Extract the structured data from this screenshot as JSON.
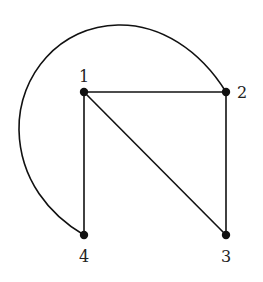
{
  "diagram": {
    "type": "graph",
    "directed": false,
    "nodes": [
      {
        "id": "1",
        "label": "1",
        "x": 84,
        "y": 92,
        "label_x": 84,
        "label_y": 77
      },
      {
        "id": "2",
        "label": "2",
        "x": 226,
        "y": 92,
        "label_x": 242,
        "label_y": 98
      },
      {
        "id": "3",
        "label": "3",
        "x": 226,
        "y": 235,
        "label_x": 226,
        "label_y": 259
      },
      {
        "id": "4",
        "label": "4",
        "x": 84,
        "y": 235,
        "label_x": 84,
        "label_y": 259
      }
    ],
    "edges": [
      {
        "from": "1",
        "to": "2",
        "shape": "line"
      },
      {
        "from": "1",
        "to": "3",
        "shape": "line"
      },
      {
        "from": "1",
        "to": "4",
        "shape": "line"
      },
      {
        "from": "2",
        "to": "3",
        "shape": "line"
      },
      {
        "from": "2",
        "to": "4",
        "shape": "arc"
      }
    ],
    "colors": {
      "stroke": "#111111",
      "node": "#111111",
      "background": "#ffffff"
    }
  }
}
